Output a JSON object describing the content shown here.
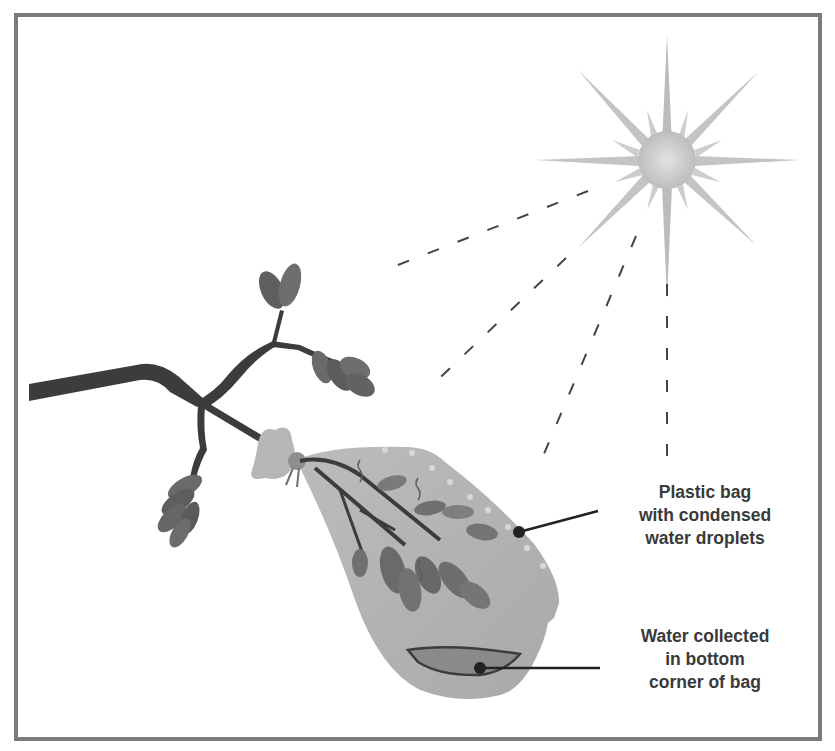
{
  "diagram": {
    "type": "illustration",
    "colors": {
      "frame": "#7a7a7a",
      "branch": "#3c3c3c",
      "leaf": "#6a6a6a",
      "bag": "#b4b4b4",
      "water": "#8c8c8c",
      "sun": "#c8c8c8",
      "rays": "#444444",
      "leader": "#222222",
      "text": "#3a3a3a"
    },
    "elements": {
      "sun": "sun-icon",
      "rays": "dashed sun rays (4)",
      "branch": "tree branch with leaves",
      "bag": "plastic bag tied over leafy branch"
    },
    "labels": [
      {
        "id": "bag",
        "lines": [
          "Plastic bag",
          "with condensed",
          "water droplets"
        ]
      },
      {
        "id": "water",
        "lines": [
          "Water collected",
          "in bottom",
          "corner of bag"
        ]
      }
    ]
  }
}
